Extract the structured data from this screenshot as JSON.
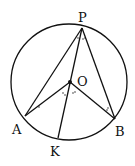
{
  "diagram": {
    "type": "circle-geometry",
    "labels": {
      "P": "P",
      "O": "O",
      "A": "A",
      "B": "B",
      "K": "K"
    },
    "points": {
      "P": [
        82,
        28
      ],
      "O": [
        70,
        82
      ],
      "A": [
        25,
        116
      ],
      "B": [
        115,
        119
      ],
      "K": [
        58,
        138
      ]
    },
    "circle": {
      "cx": 69,
      "cy": 82,
      "r": 58
    },
    "segments": [
      "PA",
      "PB",
      "PK",
      "OA",
      "OB"
    ],
    "stroke_color": "#111111"
  }
}
